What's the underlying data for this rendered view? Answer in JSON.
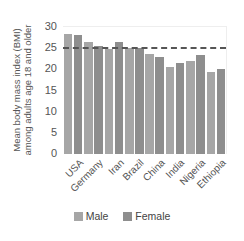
{
  "chart_data": {
    "type": "bar",
    "title": "",
    "xlabel": "",
    "ylabel": "Mean body mass index (BMI) among adults age 18 and older",
    "ylabel_lines": [
      "Mean body mass index (BMI)",
      "among adults age 18 and older"
    ],
    "ylim": [
      0,
      30
    ],
    "yticks": [
      0,
      5,
      10,
      15,
      20,
      25,
      30
    ],
    "categories": [
      "USA",
      "Germany",
      "Iran",
      "Brazil",
      "China",
      "India",
      "Nigeria",
      "Ethiopia"
    ],
    "series": [
      {
        "name": "Male",
        "color": "#a6a6a6",
        "values": [
          28.3,
          26.4,
          24.8,
          25.0,
          23.6,
          20.5,
          21.9,
          19.3
        ]
      },
      {
        "name": "Female",
        "color": "#8e8e8e",
        "values": [
          28.0,
          25.5,
          26.4,
          25.0,
          22.9,
          21.4,
          23.3,
          20.2
        ]
      }
    ],
    "reference_line": {
      "value": 25,
      "style": "dashed",
      "color": "#555555"
    },
    "grid": false,
    "legend_position": "bottom"
  }
}
